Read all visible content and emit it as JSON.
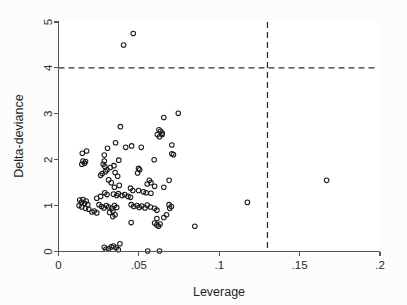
{
  "chart_data": {
    "type": "scatter",
    "title": "",
    "subtitle": "",
    "xlabel": "Leverage",
    "ylabel": "Delta-deviance",
    "xlim": [
      0,
      0.2
    ],
    "ylim": [
      0,
      5
    ],
    "xticks": [
      0,
      0.05,
      0.1,
      0.15,
      0.2
    ],
    "xticklabels": [
      "0",
      ".05",
      ".1",
      ".15",
      ".2"
    ],
    "yticks": [
      0,
      1,
      2,
      3,
      4,
      5
    ],
    "yticklabels": [
      "0",
      "1",
      "2",
      "3",
      "4",
      "5"
    ],
    "grid": false,
    "legend": null,
    "marker": "open-circle",
    "marker_size_px": 4.6,
    "annotations": [
      {
        "name": "delta-deviance-threshold",
        "type": "hline",
        "y": 4,
        "style": "dashed"
      },
      {
        "name": "leverage-threshold",
        "type": "vline",
        "x": 0.13,
        "style": "dashed"
      }
    ],
    "points": [
      [
        0.0405,
        4.5
      ],
      [
        0.0465,
        4.75
      ],
      [
        0.0745,
        3.01
      ],
      [
        0.0655,
        2.92
      ],
      [
        0.0385,
        2.72
      ],
      [
        0.0625,
        2.65
      ],
      [
        0.0635,
        2.62
      ],
      [
        0.0645,
        2.58
      ],
      [
        0.0615,
        2.55
      ],
      [
        0.0645,
        2.55
      ],
      [
        0.0628,
        2.5
      ],
      [
        0.0355,
        2.37
      ],
      [
        0.0705,
        2.32
      ],
      [
        0.0455,
        2.3
      ],
      [
        0.0515,
        2.27
      ],
      [
        0.0305,
        2.25
      ],
      [
        0.0418,
        2.27
      ],
      [
        0.0175,
        2.19
      ],
      [
        0.0148,
        2.14
      ],
      [
        0.0285,
        2.1
      ],
      [
        0.0715,
        2.11
      ],
      [
        0.0705,
        2.13
      ],
      [
        0.0595,
        2.0
      ],
      [
        0.0375,
        1.99
      ],
      [
        0.0152,
        1.97
      ],
      [
        0.0168,
        1.96
      ],
      [
        0.0162,
        1.92
      ],
      [
        0.0145,
        1.9
      ],
      [
        0.0285,
        1.97
      ],
      [
        0.0278,
        1.9
      ],
      [
        0.0288,
        1.85
      ],
      [
        0.0345,
        1.87
      ],
      [
        0.0322,
        1.83
      ],
      [
        0.0302,
        1.78
      ],
      [
        0.0292,
        1.74
      ],
      [
        0.0272,
        1.7
      ],
      [
        0.0262,
        1.66
      ],
      [
        0.0352,
        1.72
      ],
      [
        0.0368,
        1.64
      ],
      [
        0.0498,
        1.81
      ],
      [
        0.0505,
        1.78
      ],
      [
        0.0492,
        1.71
      ],
      [
        0.0688,
        1.55
      ],
      [
        0.0312,
        1.56
      ],
      [
        0.0328,
        1.5
      ],
      [
        0.0565,
        1.55
      ],
      [
        0.0575,
        1.5
      ],
      [
        0.0552,
        1.47
      ],
      [
        0.0378,
        1.44
      ],
      [
        0.0348,
        1.4
      ],
      [
        0.0598,
        1.42
      ],
      [
        0.0655,
        1.4
      ],
      [
        0.0448,
        1.38
      ],
      [
        0.0462,
        1.33
      ],
      [
        0.0498,
        1.33
      ],
      [
        0.0528,
        1.3
      ],
      [
        0.0545,
        1.28
      ],
      [
        0.0575,
        1.27
      ],
      [
        0.0288,
        1.28
      ],
      [
        0.0302,
        1.24
      ],
      [
        0.0342,
        1.25
      ],
      [
        0.0362,
        1.22
      ],
      [
        0.0372,
        1.26
      ],
      [
        0.0395,
        1.22
      ],
      [
        0.0412,
        1.24
      ],
      [
        0.0432,
        1.2
      ],
      [
        0.0448,
        1.18
      ],
      [
        0.0262,
        1.2
      ],
      [
        0.0238,
        1.16
      ],
      [
        0.0132,
        1.12
      ],
      [
        0.0142,
        1.07
      ],
      [
        0.0152,
        1.13
      ],
      [
        0.0162,
        1.05
      ],
      [
        0.0172,
        1.1
      ],
      [
        0.0182,
        1.02
      ],
      [
        0.0128,
        1.0
      ],
      [
        0.0145,
        0.97
      ],
      [
        0.0168,
        0.94
      ],
      [
        0.0188,
        0.92
      ],
      [
        0.0252,
        1.02
      ],
      [
        0.0268,
        0.98
      ],
      [
        0.0282,
        0.95
      ],
      [
        0.0298,
        1.0
      ],
      [
        0.0312,
        0.97
      ],
      [
        0.0332,
        0.94
      ],
      [
        0.0348,
        1.0
      ],
      [
        0.0362,
        0.96
      ],
      [
        0.0338,
        0.88
      ],
      [
        0.0318,
        0.85
      ],
      [
        0.0352,
        0.8
      ],
      [
        0.0338,
        0.76
      ],
      [
        0.0222,
        0.88
      ],
      [
        0.0238,
        0.84
      ],
      [
        0.0208,
        0.86
      ],
      [
        0.0452,
        1.02
      ],
      [
        0.0468,
        0.98
      ],
      [
        0.0488,
        1.0
      ],
      [
        0.0502,
        0.96
      ],
      [
        0.0518,
        0.99
      ],
      [
        0.0538,
        0.95
      ],
      [
        0.0552,
        1.01
      ],
      [
        0.0572,
        0.97
      ],
      [
        0.0598,
        0.94
      ],
      [
        0.0612,
        0.9
      ],
      [
        0.0688,
        1.02
      ],
      [
        0.0702,
        0.98
      ],
      [
        0.0692,
        0.94
      ],
      [
        0.0672,
        0.8
      ],
      [
        0.0655,
        0.74
      ],
      [
        0.0612,
        0.72
      ],
      [
        0.0598,
        0.62
      ],
      [
        0.0612,
        0.58
      ],
      [
        0.0622,
        0.55
      ],
      [
        0.0632,
        0.6
      ],
      [
        0.0452,
        0.63
      ],
      [
        0.0848,
        0.55
      ],
      [
        0.1175,
        1.07
      ],
      [
        0.1668,
        1.55
      ],
      [
        0.0285,
        0.09
      ],
      [
        0.0295,
        0.05
      ],
      [
        0.0312,
        0.06
      ],
      [
        0.0328,
        0.1
      ],
      [
        0.0342,
        0.12
      ],
      [
        0.0358,
        0.08
      ],
      [
        0.0382,
        0.17
      ],
      [
        0.0372,
        0.04
      ],
      [
        0.0555,
        0.01
      ],
      [
        0.0628,
        0.01
      ]
    ]
  }
}
